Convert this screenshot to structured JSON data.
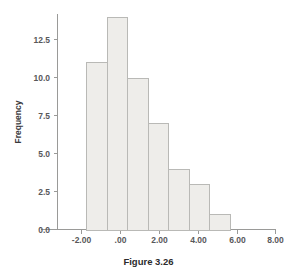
{
  "figure": {
    "caption": "Figure 3.26"
  },
  "chart_data": {
    "type": "bar",
    "title": "",
    "subtitle": "",
    "xlabel": "",
    "ylabel": "Frequency",
    "grid": false,
    "legend": false,
    "legend_position": "none",
    "bar_fill_color": "#eeedea",
    "bar_border_color": "#b9b9b6",
    "axis_color": "#9a9a98",
    "xlim": [
      -3.2,
      8.0
    ],
    "ylim": [
      0,
      14.6
    ],
    "xticks": [
      -2.0,
      0.0,
      2.0,
      4.0,
      6.0,
      8.0
    ],
    "xtick_labels": [
      "-2.00",
      ".00",
      "2.00",
      "4.00",
      "6.00",
      "8.00"
    ],
    "yticks": [
      0.0,
      2.5,
      5.0,
      7.5,
      10.0,
      12.5
    ],
    "ytick_labels": [
      "0.0",
      "2.5",
      "5.0",
      "7.5",
      "10.0",
      "12.5"
    ],
    "bin_width": 1.05,
    "bin_edges": [
      -1.75,
      -0.7,
      0.35,
      1.4,
      2.45,
      3.5,
      4.55,
      5.6
    ],
    "bin_centers": [
      -1.225,
      -0.175,
      0.875,
      1.925,
      2.975,
      4.025,
      5.075
    ],
    "values": [
      11,
      14,
      10,
      7,
      4,
      3,
      1
    ],
    "categories": [
      "-1.23",
      "-0.18",
      "0.88",
      "1.93",
      "2.98",
      "4.03",
      "5.08"
    ],
    "series": [
      {
        "name": "Frequency",
        "values": [
          11,
          14,
          10,
          7,
          4,
          3,
          1
        ]
      }
    ]
  }
}
